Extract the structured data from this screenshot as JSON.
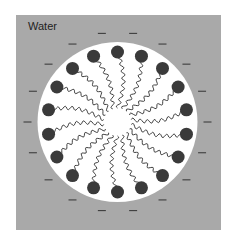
{
  "diagram": {
    "title_label": "Water",
    "type": "micelle cross-section",
    "colors": {
      "background": "#ffffff",
      "water": "#a9a9a9",
      "core": "#ffffff",
      "head": "#3a3a3a",
      "tail": "#2a2a2a",
      "charge": "#333333"
    },
    "geometry": {
      "box": [
        16,
        15,
        205,
        215
      ],
      "center": [
        117.5,
        122
      ],
      "core_radius": 80,
      "head_radius_pos": 70,
      "head_size": 6.5,
      "tail_inner_radius": 14,
      "charge_radius": 90,
      "molecule_count": 18
    },
    "molecules": {
      "head_label": "polar head group",
      "tail_label": "hydrocarbon tail",
      "charge_symbol": "−"
    }
  }
}
